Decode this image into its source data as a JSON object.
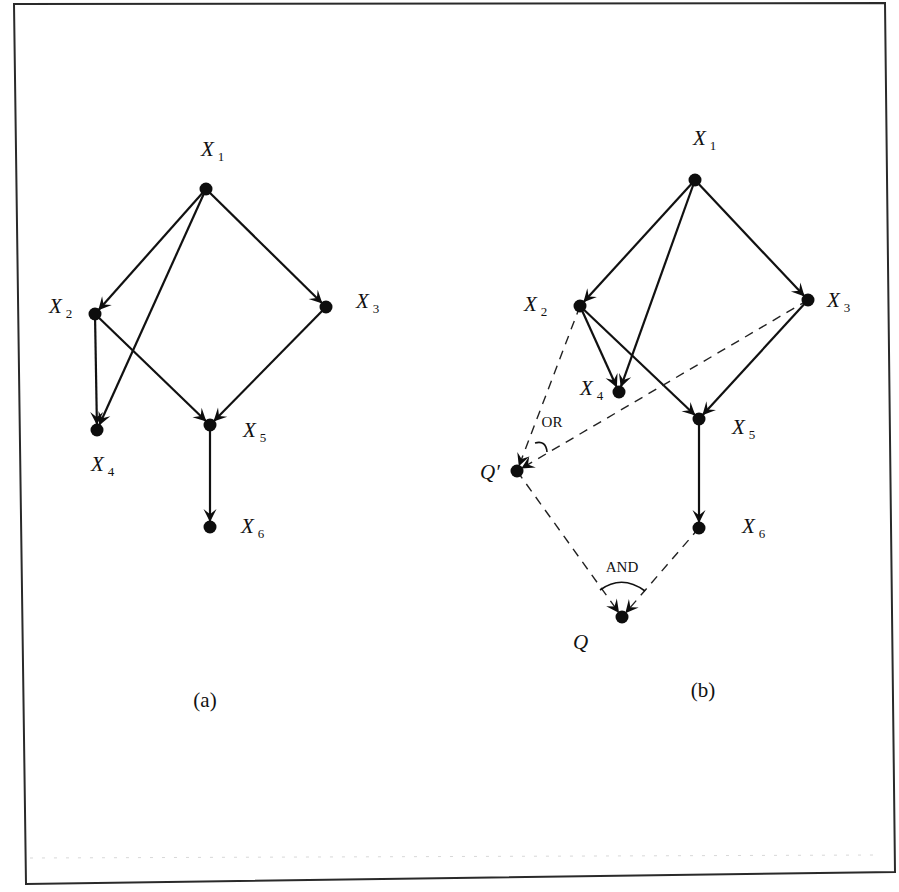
{
  "figure": {
    "frame": {
      "corners": [
        [
          14,
          4
        ],
        [
          885,
          3
        ],
        [
          895,
          872
        ],
        [
          26,
          884
        ]
      ],
      "stroke": "#2a2a2a"
    },
    "panels": [
      {
        "id": "a",
        "caption": "(a)",
        "caption_pos": [
          205,
          707
        ],
        "nodes": [
          {
            "id": "X1",
            "main": "X",
            "sub": "1",
            "x": 206,
            "y": 189,
            "lx": 201,
            "ly": 156
          },
          {
            "id": "X2",
            "main": "X",
            "sub": "2",
            "x": 95,
            "y": 314,
            "lx": 49,
            "ly": 313
          },
          {
            "id": "X3",
            "main": "X",
            "sub": "3",
            "x": 326,
            "y": 307,
            "lx": 356,
            "ly": 308
          },
          {
            "id": "X4",
            "main": "X",
            "sub": "4",
            "x": 97,
            "y": 430,
            "lx": 91,
            "ly": 471
          },
          {
            "id": "X5",
            "main": "X",
            "sub": "5",
            "x": 210,
            "y": 425,
            "lx": 243,
            "ly": 437
          },
          {
            "id": "X6",
            "main": "X",
            "sub": "6",
            "x": 210,
            "y": 527,
            "lx": 241,
            "ly": 533
          }
        ],
        "edges": [
          {
            "from": "X1",
            "to": "X2",
            "style": "solid",
            "arrow": true
          },
          {
            "from": "X1",
            "to": "X3",
            "style": "solid",
            "arrow": true
          },
          {
            "from": "X1",
            "to": "X4",
            "style": "solid",
            "arrow": true
          },
          {
            "from": "X2",
            "to": "X4",
            "style": "solid",
            "arrow": true
          },
          {
            "from": "X2",
            "to": "X5",
            "style": "solid",
            "arrow": true
          },
          {
            "from": "X3",
            "to": "X5",
            "style": "solid",
            "arrow": true
          },
          {
            "from": "X5",
            "to": "X6",
            "style": "solid",
            "arrow": true
          }
        ],
        "gates": []
      },
      {
        "id": "b",
        "caption": "(b)",
        "caption_pos": [
          703,
          697
        ],
        "nodes": [
          {
            "id": "X1",
            "main": "X",
            "sub": "1",
            "x": 695,
            "y": 180,
            "lx": 693,
            "ly": 145
          },
          {
            "id": "X2",
            "main": "X",
            "sub": "2",
            "x": 580,
            "y": 306,
            "lx": 524,
            "ly": 311
          },
          {
            "id": "X3",
            "main": "X",
            "sub": "3",
            "x": 808,
            "y": 300,
            "lx": 827,
            "ly": 307
          },
          {
            "id": "X4",
            "main": "X",
            "sub": "4",
            "x": 619,
            "y": 392,
            "lx": 580,
            "ly": 395
          },
          {
            "id": "X5",
            "main": "X",
            "sub": "5",
            "x": 699,
            "y": 419,
            "lx": 732,
            "ly": 434
          },
          {
            "id": "X6",
            "main": "X",
            "sub": "6",
            "x": 699,
            "y": 528,
            "lx": 742,
            "ly": 533
          },
          {
            "id": "Qp",
            "main": "Q′",
            "sub": "",
            "x": 517,
            "y": 471,
            "lx": 480,
            "ly": 479
          },
          {
            "id": "Q",
            "main": "Q",
            "sub": "",
            "x": 622,
            "y": 617,
            "lx": 573,
            "ly": 649
          }
        ],
        "edges": [
          {
            "from": "X1",
            "to": "X2",
            "style": "solid",
            "arrow": true
          },
          {
            "from": "X1",
            "to": "X3",
            "style": "solid",
            "arrow": true
          },
          {
            "from": "X1",
            "to": "X4",
            "style": "solid",
            "arrow": true
          },
          {
            "from": "X2",
            "to": "X4",
            "style": "solid",
            "arrow": true
          },
          {
            "from": "X2",
            "to": "X5",
            "style": "solid",
            "arrow": true
          },
          {
            "from": "X3",
            "to": "X5",
            "style": "solid",
            "arrow": true
          },
          {
            "from": "X5",
            "to": "X6",
            "style": "solid",
            "arrow": true
          },
          {
            "from": "X2",
            "to": "Qp",
            "style": "dashed",
            "arrow": true
          },
          {
            "from": "X3",
            "to": "Qp",
            "style": "dashed",
            "arrow": true
          },
          {
            "from": "Qp",
            "to": "Q",
            "style": "dashed",
            "arrow": true
          },
          {
            "from": "X6",
            "to": "Q",
            "style": "dashed",
            "arrow": true
          }
        ],
        "gates": [
          {
            "label": "OR",
            "node": "Qp",
            "label_pos": [
              552,
              427
            ],
            "arc": "M 535 443 Q 546 440 547 452"
          },
          {
            "label": "AND",
            "node": "Q",
            "label_pos": [
              622,
              572
            ],
            "arc": "M 600 590 Q 622 574 645 591"
          }
        ]
      }
    ]
  }
}
